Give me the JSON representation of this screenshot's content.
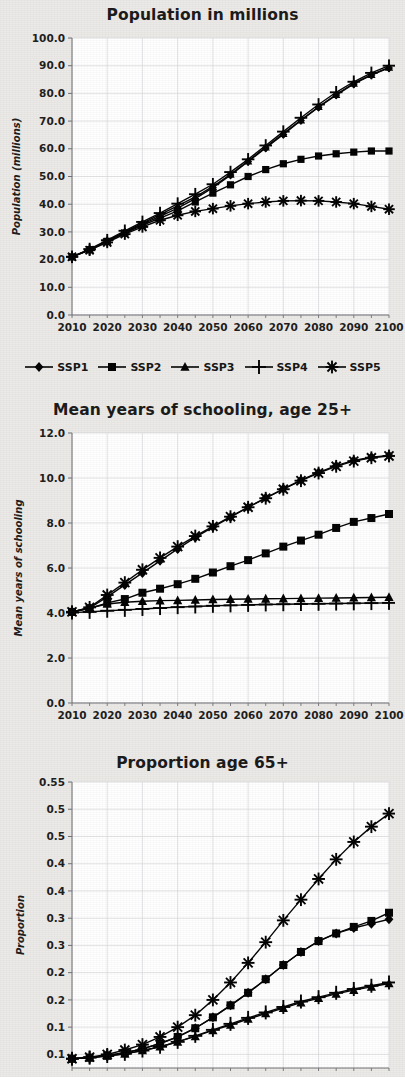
{
  "legend": {
    "position": "below-chart-1",
    "entries": [
      {
        "label": "SSP1",
        "marker": "diamond"
      },
      {
        "label": "SSP2",
        "marker": "square"
      },
      {
        "label": "SSP3",
        "marker": "triangle"
      },
      {
        "label": "SSP4",
        "marker": "plus"
      },
      {
        "label": "SSP5",
        "marker": "asterisk"
      }
    ]
  },
  "chart_data": [
    {
      "id": "population",
      "type": "line",
      "title": "Population in millions",
      "xlabel": "",
      "ylabel": "Population (millions)",
      "x": [
        2010,
        2015,
        2020,
        2025,
        2030,
        2035,
        2040,
        2045,
        2050,
        2055,
        2060,
        2065,
        2070,
        2075,
        2080,
        2085,
        2090,
        2095,
        2100
      ],
      "xlim": [
        2010,
        2100
      ],
      "ylim": [
        0.0,
        100.0
      ],
      "xticks": [
        2010,
        2020,
        2030,
        2040,
        2050,
        2060,
        2070,
        2080,
        2090,
        2100
      ],
      "yticks": [
        0.0,
        10.0,
        20.0,
        30.0,
        40.0,
        50.0,
        60.0,
        70.0,
        80.0,
        90.0,
        100.0
      ],
      "ytick_labels": [
        "0.0",
        "10.0",
        "20.0",
        "30.0",
        "40.0",
        "50.0",
        "60.0",
        "70.0",
        "80.0",
        "90.0",
        "100.0"
      ],
      "xtick_labels": [
        "2010",
        "2020",
        "2030",
        "2040",
        "2050",
        "2060",
        "2070",
        "2080",
        "2090",
        "2100"
      ],
      "grid": true,
      "legend": true,
      "series": [
        {
          "name": "SSP1",
          "marker": "diamond",
          "values": [
            21.0,
            23.5,
            26.5,
            29.8,
            32.8,
            35.6,
            38.6,
            42.0,
            46.0,
            50.5,
            55.4,
            60.3,
            65.2,
            70.2,
            75.0,
            79.4,
            83.4,
            86.6,
            89.2
          ]
        },
        {
          "name": "SSP2",
          "marker": "square",
          "values": [
            21.0,
            23.6,
            26.6,
            29.6,
            32.4,
            35.0,
            37.6,
            40.8,
            44.0,
            47.0,
            50.0,
            52.5,
            54.6,
            56.2,
            57.4,
            58.2,
            58.8,
            59.2,
            59.2
          ]
        },
        {
          "name": "SSP3",
          "marker": "triangle",
          "values": [
            21.0,
            23.6,
            26.7,
            30.0,
            33.2,
            36.2,
            39.4,
            42.6,
            46.4,
            50.8,
            55.6,
            60.6,
            65.5,
            70.4,
            75.2,
            79.6,
            83.6,
            86.8,
            89.4
          ]
        },
        {
          "name": "SSP4",
          "marker": "plus",
          "values": [
            21.0,
            23.8,
            27.0,
            30.4,
            33.6,
            36.8,
            40.2,
            43.6,
            47.2,
            51.6,
            56.2,
            61.2,
            66.2,
            71.2,
            76.0,
            80.4,
            84.2,
            87.4,
            90.0
          ]
        },
        {
          "name": "SSP5",
          "marker": "asterisk",
          "values": [
            21.0,
            23.4,
            26.2,
            29.2,
            31.8,
            34.2,
            36.0,
            37.4,
            38.4,
            39.4,
            40.2,
            40.8,
            41.2,
            41.3,
            41.2,
            40.8,
            40.2,
            39.2,
            38.2
          ]
        }
      ]
    },
    {
      "id": "schooling",
      "type": "line",
      "title": "Mean years of schooling, age 25+",
      "xlabel": "",
      "ylabel": "Mean years of schooling",
      "x": [
        2010,
        2015,
        2020,
        2025,
        2030,
        2035,
        2040,
        2045,
        2050,
        2055,
        2060,
        2065,
        2070,
        2075,
        2080,
        2085,
        2090,
        2095,
        2100
      ],
      "xlim": [
        2010,
        2100
      ],
      "ylim": [
        0.0,
        12.0
      ],
      "xticks": [
        2010,
        2020,
        2030,
        2040,
        2050,
        2060,
        2070,
        2080,
        2090,
        2100
      ],
      "yticks": [
        0.0,
        2.0,
        4.0,
        6.0,
        8.0,
        10.0,
        12.0
      ],
      "ytick_labels": [
        "0.0",
        "2.0",
        "4.0",
        "6.0",
        "8.0",
        "10.0",
        "12.0"
      ],
      "xtick_labels": [
        "2010",
        "2020",
        "2030",
        "2040",
        "2050",
        "2060",
        "2070",
        "2080",
        "2090",
        "2100"
      ],
      "grid": true,
      "legend": false,
      "series": [
        {
          "name": "SSP1",
          "marker": "diamond",
          "values": [
            4.05,
            4.22,
            4.72,
            5.25,
            5.78,
            6.32,
            6.85,
            7.36,
            7.82,
            8.26,
            8.7,
            9.12,
            9.52,
            9.9,
            10.25,
            10.55,
            10.78,
            10.92,
            11.0
          ]
        },
        {
          "name": "SSP2",
          "marker": "square",
          "values": [
            4.05,
            4.2,
            4.45,
            4.62,
            4.9,
            5.08,
            5.28,
            5.52,
            5.8,
            6.08,
            6.35,
            6.65,
            6.95,
            7.22,
            7.48,
            7.78,
            8.05,
            8.22,
            8.4
          ]
        },
        {
          "name": "SSP3",
          "marker": "triangle",
          "values": [
            4.05,
            4.22,
            4.4,
            4.48,
            4.52,
            4.55,
            4.56,
            4.58,
            4.6,
            4.61,
            4.62,
            4.63,
            4.64,
            4.65,
            4.66,
            4.67,
            4.68,
            4.69,
            4.7
          ]
        },
        {
          "name": "SSP4",
          "marker": "plus",
          "values": [
            4.02,
            4.05,
            4.1,
            4.14,
            4.18,
            4.22,
            4.26,
            4.29,
            4.32,
            4.34,
            4.36,
            4.38,
            4.39,
            4.4,
            4.41,
            4.42,
            4.43,
            4.44,
            4.45
          ]
        },
        {
          "name": "SSP5",
          "marker": "asterisk",
          "values": [
            4.05,
            4.25,
            4.8,
            5.35,
            5.92,
            6.45,
            6.95,
            7.42,
            7.85,
            8.28,
            8.7,
            9.1,
            9.5,
            9.88,
            10.22,
            10.52,
            10.75,
            10.9,
            10.98
          ]
        }
      ]
    },
    {
      "id": "proportion65",
      "type": "line",
      "title": "Proportion age 65+",
      "xlabel": "",
      "ylabel": "Proportion",
      "x": [
        2010,
        2015,
        2020,
        2025,
        2030,
        2035,
        2040,
        2045,
        2050,
        2055,
        2060,
        2065,
        2070,
        2075,
        2080,
        2085,
        2090,
        2095,
        2100
      ],
      "xlim": [
        2010,
        2100
      ],
      "ylim": [
        0.025,
        0.55
      ],
      "xticks": [
        2010,
        2020,
        2030,
        2040,
        2050,
        2060,
        2070,
        2080,
        2090,
        2100
      ],
      "yticks": [
        0.05,
        0.1,
        0.15,
        0.2,
        0.25,
        0.3,
        0.35,
        0.4,
        0.45,
        0.5,
        0.55
      ],
      "ytick_labels": [
        "0.1",
        "0.1",
        "0.2",
        "0.2",
        "0.3",
        "0.3",
        "0.4",
        "0.4",
        "0.5",
        "0.5"
      ],
      "xtick_labels": [
        "2010",
        "2020",
        "2030",
        "2040",
        "2050",
        "2060",
        "2070",
        "2080",
        "2090",
        "2100"
      ],
      "grid": true,
      "legend": false,
      "clipped_bottom": true,
      "series": [
        {
          "name": "SSP1",
          "marker": "diamond",
          "values": [
            0.042,
            0.044,
            0.048,
            0.053,
            0.06,
            0.07,
            0.082,
            0.098,
            0.118,
            0.14,
            0.163,
            0.188,
            0.214,
            0.238,
            0.258,
            0.272,
            0.282,
            0.29,
            0.298
          ]
        },
        {
          "name": "SSP2",
          "marker": "square",
          "values": [
            0.042,
            0.044,
            0.048,
            0.053,
            0.06,
            0.07,
            0.082,
            0.098,
            0.118,
            0.14,
            0.163,
            0.188,
            0.214,
            0.238,
            0.258,
            0.272,
            0.284,
            0.295,
            0.31
          ]
        },
        {
          "name": "SSP3",
          "marker": "triangle",
          "values": [
            0.042,
            0.044,
            0.047,
            0.051,
            0.057,
            0.064,
            0.073,
            0.083,
            0.094,
            0.104,
            0.115,
            0.125,
            0.135,
            0.145,
            0.153,
            0.161,
            0.168,
            0.174,
            0.18
          ]
        },
        {
          "name": "SSP4",
          "marker": "plus",
          "values": [
            0.042,
            0.044,
            0.047,
            0.051,
            0.057,
            0.064,
            0.073,
            0.084,
            0.095,
            0.106,
            0.117,
            0.127,
            0.137,
            0.147,
            0.155,
            0.163,
            0.17,
            0.176,
            0.182
          ]
        },
        {
          "name": "SSP5",
          "marker": "asterisk",
          "values": [
            0.042,
            0.045,
            0.05,
            0.058,
            0.068,
            0.082,
            0.1,
            0.122,
            0.15,
            0.182,
            0.218,
            0.256,
            0.296,
            0.334,
            0.372,
            0.408,
            0.44,
            0.468,
            0.492
          ]
        }
      ]
    }
  ]
}
